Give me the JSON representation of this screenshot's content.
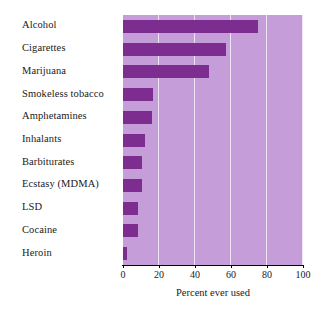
{
  "chart_data": {
    "type": "bar",
    "orientation": "horizontal",
    "title": "",
    "xlabel": "Percent ever used",
    "ylabel": "",
    "xlim": [
      0,
      100
    ],
    "xticks": [
      0,
      20,
      40,
      60,
      80,
      100
    ],
    "grid": true,
    "legend": null,
    "categories": [
      "Alcohol",
      "Cigarettes",
      "Marijuana",
      "Smokeless tobacco",
      "Amphetamines",
      "Inhalants",
      "Barbiturates",
      "Ecstasy (MDMA)",
      "LSD",
      "Cocaine",
      "Heroin"
    ],
    "values": [
      75,
      57,
      48,
      16.5,
      16,
      12,
      10.5,
      10.5,
      8.5,
      8.5,
      2
    ],
    "colors": {
      "bar": "#7c2d8f",
      "plot_background": "#c59dd8",
      "gridline": "#efe4f5",
      "page_background": "#ffffff",
      "text": "#1a1a1a",
      "axis_line": "#000000"
    }
  }
}
